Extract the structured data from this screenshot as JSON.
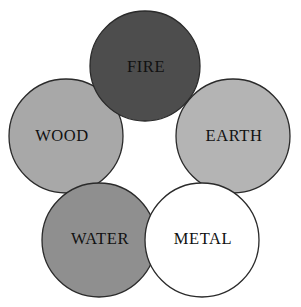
{
  "diagram": {
    "background_color": "#ffffff",
    "outline_color": "#2a2a2a",
    "label_color": "#111111",
    "circles": [
      {
        "id": "fire",
        "label": "FIRE",
        "fill": "#4d4d4d",
        "label_fill": "#111111",
        "cx": 145,
        "cy": 66,
        "r": 55,
        "label_x": 146,
        "label_y": 68,
        "order": 1
      },
      {
        "id": "wood",
        "label": "WOOD",
        "fill": "#a8a8a8",
        "label_fill": "#111111",
        "cx": 66,
        "cy": 136,
        "r": 57,
        "label_x": 62,
        "label_y": 137,
        "order": 2
      },
      {
        "id": "earth",
        "label": "EARTH",
        "fill": "#b4b4b4",
        "label_fill": "#111111",
        "cx": 233,
        "cy": 136,
        "r": 57,
        "label_x": 234,
        "label_y": 137,
        "order": 3
      },
      {
        "id": "water",
        "label": "WATER",
        "fill": "#8f8f8f",
        "label_fill": "#111111",
        "cx": 99,
        "cy": 240,
        "r": 57,
        "label_x": 100,
        "label_y": 240,
        "order": 4
      },
      {
        "id": "metal",
        "label": "METAL",
        "fill": "#ffffff",
        "label_fill": "#111111",
        "cx": 202,
        "cy": 240,
        "r": 57,
        "label_x": 203,
        "label_y": 240,
        "order": 5
      }
    ]
  }
}
